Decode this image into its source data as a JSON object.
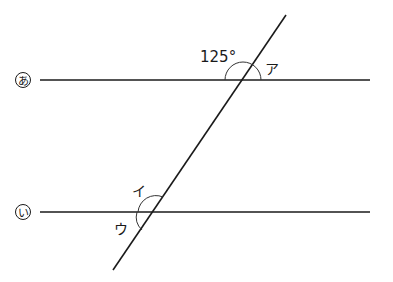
{
  "diagram": {
    "type": "parallel-lines-transversal",
    "lines": {
      "a": {
        "label": "あ",
        "y": 80,
        "x1": 40,
        "x2": 370
      },
      "b": {
        "label": "い",
        "y": 212,
        "x1": 40,
        "x2": 370
      },
      "transversal": {
        "x1": 286,
        "y1": 15,
        "x2": 113,
        "y2": 270
      }
    },
    "given_angle": {
      "value": "125°",
      "position": "upper-left at line あ"
    },
    "angle_labels": {
      "a": "ア",
      "i": "イ",
      "u": "ウ"
    },
    "colors": {
      "stroke": "#1a1a1a",
      "background": "#ffffff"
    }
  }
}
